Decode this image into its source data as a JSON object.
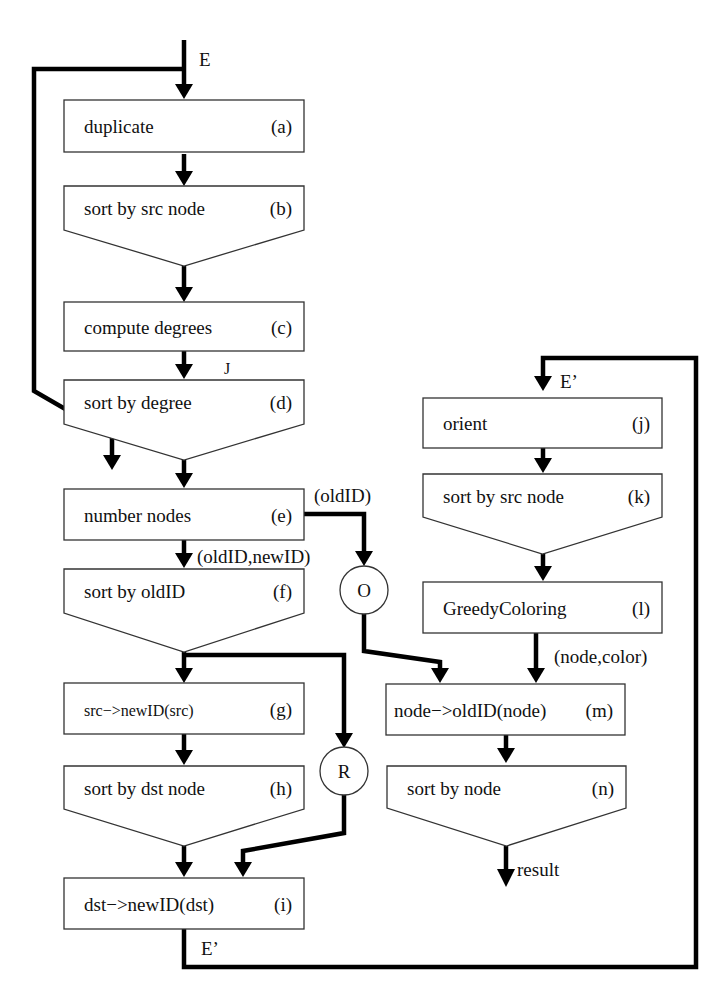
{
  "input_label": "E",
  "output_label": "result",
  "nodes": [
    {
      "id": "a",
      "label": "duplicate",
      "tag": "(a)",
      "shape": "rect"
    },
    {
      "id": "b",
      "label": "sort by src node",
      "tag": "(b)",
      "shape": "sort"
    },
    {
      "id": "c",
      "label": "compute degrees",
      "tag": "(c)",
      "shape": "rect"
    },
    {
      "id": "d",
      "label": "sort by degree",
      "tag": "(d)",
      "shape": "sort"
    },
    {
      "id": "e",
      "label": "number nodes",
      "tag": "(e)",
      "shape": "rect"
    },
    {
      "id": "f",
      "label": "sort by oldID",
      "tag": "(f)",
      "shape": "sort"
    },
    {
      "id": "g",
      "label": "src−>newID(src)",
      "tag": "(g)",
      "shape": "rect"
    },
    {
      "id": "h",
      "label": "sort by dst node",
      "tag": "(h)",
      "shape": "sort"
    },
    {
      "id": "i",
      "label": "dst−>newID(dst)",
      "tag": "(i)",
      "shape": "rect"
    },
    {
      "id": "j",
      "label": "orient",
      "tag": "(j)",
      "shape": "rect"
    },
    {
      "id": "k",
      "label": "sort by src node",
      "tag": "(k)",
      "shape": "sort"
    },
    {
      "id": "l",
      "label": "GreedyColoring",
      "tag": "(l)",
      "shape": "rect"
    },
    {
      "id": "m",
      "label": "node−>oldID(node)",
      "tag": "(m)",
      "shape": "rect"
    },
    {
      "id": "n",
      "label": "sort by node",
      "tag": "(n)",
      "shape": "sort"
    }
  ],
  "circles": [
    {
      "id": "O",
      "label": "O"
    },
    {
      "id": "R",
      "label": "R"
    }
  ],
  "edge_labels": {
    "J": "J",
    "oldID": "(oldID)",
    "oldID_newID": "(oldID,newID)",
    "E_prime_out": "E’",
    "E_prime_in": "E’",
    "node_color": "(node,color)"
  }
}
